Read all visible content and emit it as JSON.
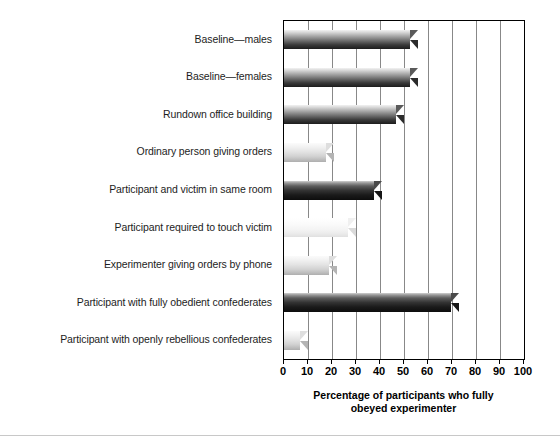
{
  "chart_data": {
    "type": "bar",
    "orientation": "horizontal",
    "title": "",
    "subtitle": "",
    "xlabel_lines": [
      "Percentage of participants who fully",
      "obeyed experimenter"
    ],
    "xlabel": "Percentage of participants who fully obeyed experimenter",
    "ylabel": "",
    "categories": [
      "Baseline—males",
      "Baseline—females",
      "Rundown office building",
      "Ordinary person giving orders",
      "Participant and victim in same room",
      "Participant required to touch victim",
      "Experimenter giving orders by phone",
      "Participant with fully obedient confederates",
      "Participant with openly rebellious confederates"
    ],
    "values": [
      56,
      56,
      50,
      21,
      41,
      30,
      22,
      73,
      10
    ],
    "bar_styles": [
      "dark",
      "dark",
      "dark",
      "light",
      "darker",
      "pale",
      "light",
      "darker",
      "light"
    ],
    "xlim": [
      0,
      100
    ],
    "xticks": [
      0,
      10,
      20,
      30,
      40,
      50,
      60,
      70,
      80,
      90,
      100
    ],
    "xtick_labels": [
      "0",
      "10",
      "20",
      "30",
      "40",
      "50",
      "60",
      "70",
      "80",
      "90",
      "100"
    ],
    "grid": {
      "vertical": true,
      "horizontal": false,
      "color": "#888888"
    },
    "legend": {
      "present": false,
      "position": "none",
      "entries": []
    },
    "plot_frame_color": "#000000",
    "background_color": "#ffffff"
  }
}
